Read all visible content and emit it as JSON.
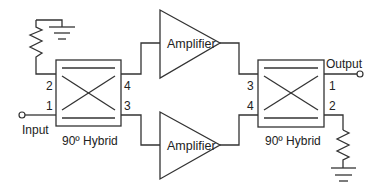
{
  "diagram": {
    "title": "",
    "colors": {
      "line": "#333333",
      "text": "#222222",
      "background": "#ffffff"
    },
    "input_label": "Input",
    "output_label": "Output",
    "hybrids": [
      {
        "id": "left",
        "label": "90º Hybrid",
        "ports": {
          "p1": "1",
          "p2": "2",
          "p3": "3",
          "p4": "4"
        }
      },
      {
        "id": "right",
        "label": "90º Hybrid",
        "ports": {
          "p1": "1",
          "p2": "2",
          "p3": "3",
          "p4": "4"
        }
      }
    ],
    "amplifiers": [
      {
        "id": "top",
        "label": "Amplifier"
      },
      {
        "id": "bottom",
        "label": "Amplifier"
      }
    ],
    "terminations": [
      {
        "id": "left-termination",
        "type": "resistor-to-ground"
      },
      {
        "id": "right-termination",
        "type": "resistor-to-ground"
      }
    ]
  }
}
